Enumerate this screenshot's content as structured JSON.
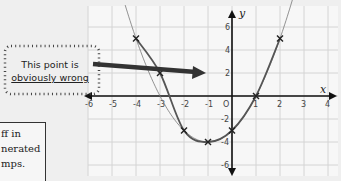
{
  "callout": {
    "line1": "This point is",
    "line2": "obviously wrong"
  },
  "note": {
    "lines": [
      "ff in",
      "nerated",
      "mps."
    ]
  },
  "colors": {
    "grid": "#d2d2d2",
    "axis": "#111111",
    "curve": "#555555",
    "arrow": "#333333",
    "background": "#efefef"
  },
  "chart_data": {
    "type": "scatter",
    "title": "",
    "xlabel": "x",
    "ylabel": "y",
    "xlim": [
      -6,
      4
    ],
    "ylim": [
      -6,
      7
    ],
    "grid": true,
    "x_ticks": [
      -6,
      -5,
      -4,
      -3,
      -2,
      -1,
      0,
      1,
      2,
      3,
      4
    ],
    "x_tick_labels": [
      "-6",
      "-5",
      "-4",
      "-3",
      "-2",
      "-1",
      "O",
      "1",
      "2",
      "3",
      "4"
    ],
    "y_ticks": [
      6,
      4,
      2,
      -2,
      -4,
      -6
    ],
    "y_tick_labels": [
      "6",
      "4",
      "2",
      "-2",
      "-4",
      "-6"
    ],
    "series": [
      {
        "name": "plotted points (x marks)",
        "x": [
          -4,
          -3,
          -2,
          -1,
          0,
          1,
          2
        ],
        "y": [
          5,
          2,
          -3,
          -4,
          -3,
          0,
          5
        ]
      },
      {
        "name": "curve through plotted points",
        "type": "line",
        "x": [
          -4,
          -3,
          -2,
          -1,
          0,
          1,
          2
        ],
        "y": [
          5,
          2,
          -3,
          -4,
          -3,
          0,
          5
        ]
      },
      {
        "name": "correct curve y = x^2 + 2x - 3",
        "type": "line",
        "x": [
          -4.4,
          -4,
          -3,
          -2,
          -1,
          0,
          1,
          2,
          2.6
        ],
        "y": [
          7.56,
          5,
          0,
          -3,
          -4,
          -3,
          0,
          5,
          8.96
        ]
      }
    ],
    "annotations": [
      {
        "text": "This point is obviously wrong",
        "points_to": [
          -3,
          2
        ]
      }
    ]
  }
}
